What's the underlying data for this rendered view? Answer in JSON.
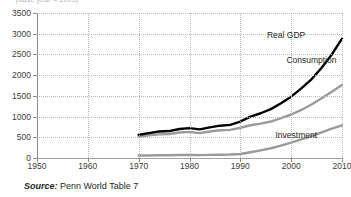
{
  "figure": {
    "top_note": "(base year = 2005)",
    "source_prefix": "Source:",
    "source_text": " Penn World Table 7"
  },
  "chart_data": {
    "type": "line",
    "title": "",
    "subtitle": "",
    "xlabel": "",
    "ylabel": "",
    "xlim": [
      1950,
      2010
    ],
    "ylim": [
      0,
      3500
    ],
    "xticks": [
      "1950",
      "1960",
      "1970",
      "1980",
      "1990",
      "2000",
      "2010"
    ],
    "yticks": [
      "0",
      "500",
      "1000",
      "1500",
      "2000",
      "2500",
      "3000",
      "3500"
    ],
    "grid": true,
    "legend_position": "inline-annotations",
    "x": [
      1970,
      1972,
      1974,
      1976,
      1978,
      1980,
      1982,
      1984,
      1986,
      1988,
      1990,
      1992,
      1994,
      1996,
      1998,
      2000,
      2002,
      2004,
      2006,
      2008,
      2010
    ],
    "series": [
      {
        "name": "Real GDP",
        "color": "#000000",
        "label_x": 1999,
        "label_y": 2980,
        "values": [
          560,
          600,
          640,
          650,
          700,
          720,
          690,
          740,
          780,
          800,
          880,
          1000,
          1080,
          1180,
          1320,
          1480,
          1680,
          1900,
          2180,
          2500,
          2880
        ]
      },
      {
        "name": "Consumption",
        "color": "#9a9a9a",
        "label_x": 2004,
        "label_y": 2360,
        "values": [
          520,
          545,
          570,
          580,
          615,
          630,
          600,
          640,
          670,
          680,
          730,
          790,
          830,
          880,
          960,
          1050,
          1160,
          1290,
          1440,
          1600,
          1760
        ]
      },
      {
        "name": "Investment",
        "color": "#9a9a9a",
        "label_x": 2001,
        "label_y": 560,
        "values": [
          60,
          62,
          66,
          68,
          72,
          74,
          70,
          76,
          80,
          84,
          96,
          140,
          185,
          235,
          300,
          370,
          450,
          530,
          620,
          710,
          790
        ]
      }
    ]
  }
}
